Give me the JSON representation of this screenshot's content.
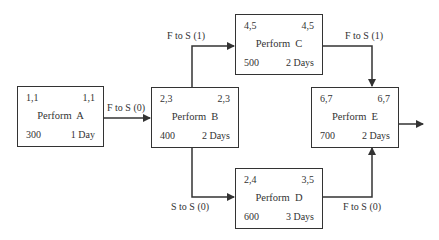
{
  "diagram": {
    "type": "precedence network diagram",
    "nodes": [
      {
        "id": "A",
        "title": "Perform  A",
        "early": "1,1",
        "late": "1,1",
        "cost": "300",
        "duration": "1 Day"
      },
      {
        "id": "B",
        "title": "Perform  B",
        "early": "2,3",
        "late": "2,3",
        "cost": "400",
        "duration": "2 Days"
      },
      {
        "id": "C",
        "title": "Perform  C",
        "early": "4,5",
        "late": "4,5",
        "cost": "500",
        "duration": "2 Days"
      },
      {
        "id": "D",
        "title": "Perform  D",
        "early": "2,4",
        "late": "3,5",
        "cost": "600",
        "duration": "3 Days"
      },
      {
        "id": "E",
        "title": "Perform  E",
        "early": "6,7",
        "late": "6,7",
        "cost": "700",
        "duration": "2 Days"
      }
    ],
    "links": [
      {
        "from": "A",
        "to": "B",
        "label": "F to S (0)"
      },
      {
        "from": "B",
        "to": "C",
        "label": "F to S (1)"
      },
      {
        "from": "B",
        "to": "D",
        "label": "S to S (0)"
      },
      {
        "from": "C",
        "to": "E",
        "label": "F to S (1)"
      },
      {
        "from": "D",
        "to": "E",
        "label": "F to S (0)"
      }
    ],
    "colors": {
      "line": "#333333",
      "background": "#ffffff"
    }
  }
}
